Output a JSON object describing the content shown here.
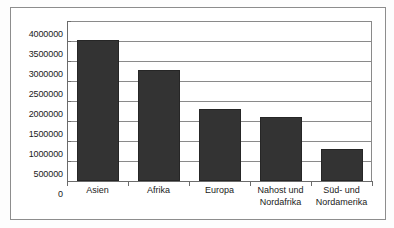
{
  "chart_data": {
    "type": "bar",
    "title": "",
    "xlabel": "",
    "ylabel": "",
    "categories": [
      "Asien",
      "Afrika",
      "Europa",
      "Nahost und\nNordafrika",
      "Süd- und\nNordamerika"
    ],
    "values": [
      3530000,
      2780000,
      1800000,
      1600000,
      800000
    ],
    "ylim": [
      0,
      4000000
    ],
    "ytick_labels": [
      "4000000",
      "3500000",
      "3000000",
      "2500000",
      "2000000",
      "1500000",
      "1000000",
      "500000",
      "0"
    ],
    "ytick_values": [
      4000000,
      3500000,
      3000000,
      2500000,
      2000000,
      1500000,
      1000000,
      500000,
      0
    ],
    "grid": true,
    "legend": false,
    "bar_color": "#333333",
    "grid_color": "#8a8a8a",
    "axis_color": "#6b6b6b",
    "frame_color": "#8d8d8d"
  }
}
